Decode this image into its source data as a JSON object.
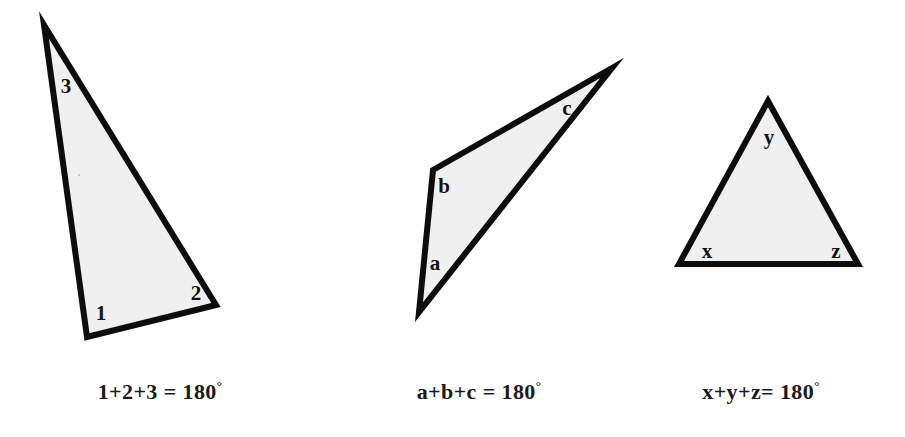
{
  "figure": {
    "background_color": "#ffffff",
    "fill_color": "#f0f0f0",
    "stroke_color": "#0d0d0d"
  },
  "triangles": [
    {
      "id": "triangle-1",
      "name": "numbered-triangle",
      "points": "44,25 87,337 216,305",
      "labels": [
        {
          "text": "3",
          "x": 66,
          "y": 86
        },
        {
          "text": "1",
          "x": 101,
          "y": 313
        },
        {
          "text": "2",
          "x": 196,
          "y": 293
        }
      ],
      "caption": {
        "lead": "1+2+3 = 180",
        "degree": "°",
        "full": "1+2+3 = 180°",
        "x": 160,
        "y": 391
      }
    },
    {
      "id": "triangle-2",
      "name": "lettered-triangle-abc",
      "points": "612,68 433,170 419,312",
      "labels": [
        {
          "text": "b",
          "x": 444,
          "y": 186
        },
        {
          "text": "a",
          "x": 435,
          "y": 263
        },
        {
          "text": "c",
          "x": 567,
          "y": 108
        }
      ],
      "caption": {
        "lead": "a+b+c = 180",
        "degree": "°",
        "full": "a+b+c = 180°",
        "x": 479,
        "y": 391
      }
    },
    {
      "id": "triangle-3",
      "name": "lettered-triangle-xyz",
      "points": "768,101 679,264 858,264",
      "labels": [
        {
          "text": "y",
          "x": 769,
          "y": 137
        },
        {
          "text": "x",
          "x": 707,
          "y": 251
        },
        {
          "text": "z",
          "x": 836,
          "y": 251
        }
      ],
      "caption": {
        "lead": "x+y+z= 180",
        "degree": "°",
        "full": "x+y+z= 180°",
        "x": 761,
        "y": 391
      }
    }
  ],
  "artifacts": [
    {
      "name": "scan-speck",
      "x": 78,
      "y": 174
    }
  ]
}
